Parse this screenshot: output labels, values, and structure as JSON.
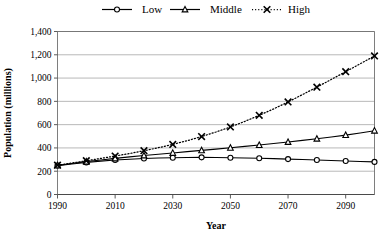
{
  "chart_data": {
    "type": "line",
    "title": "",
    "xlabel": "Year",
    "ylabel": "Population (millions)",
    "xlim": [
      1990,
      2100
    ],
    "ylim": [
      0,
      1400
    ],
    "ytick_step": 200,
    "xtick_step": 20,
    "grid": true,
    "legend_position": "top-center",
    "yticks": [
      "0",
      "200",
      "400",
      "600",
      "800",
      "1,000",
      "1,200",
      "1,400"
    ],
    "ytick_values": [
      0,
      200,
      400,
      600,
      800,
      1000,
      1200,
      1400
    ],
    "xticks": [
      "1990",
      "2010",
      "2030",
      "2050",
      "2070",
      "2090"
    ],
    "xtick_values": [
      1990,
      2010,
      2030,
      2050,
      2070,
      2090
    ],
    "x": [
      1990,
      1995,
      2000,
      2005,
      2010,
      2015,
      2020,
      2025,
      2030,
      2035,
      2040,
      2045,
      2050,
      2055,
      2060,
      2065,
      2070,
      2075,
      2080,
      2085,
      2090,
      2095,
      2100
    ],
    "series": [
      {
        "name": "Low",
        "marker": "circle",
        "line_style": "solid",
        "color": "#000000",
        "values": [
          248,
          262,
          275,
          287,
          296,
          303,
          309,
          313,
          316,
          318,
          319,
          318,
          316,
          314,
          311,
          308,
          304,
          300,
          296,
          292,
          288,
          284,
          280
        ]
      },
      {
        "name": "Middle",
        "marker": "triangle",
        "line_style": "solid",
        "color": "#000000",
        "values": [
          250,
          266,
          282,
          296,
          310,
          323,
          335,
          346,
          357,
          368,
          379,
          390,
          401,
          413,
          425,
          438,
          451,
          465,
          479,
          494,
          510,
          528,
          548
        ]
      },
      {
        "name": "High",
        "marker": "x",
        "line_style": "dotted",
        "color": "#000000",
        "values": [
          252,
          270,
          290,
          310,
          330,
          352,
          376,
          402,
          430,
          462,
          498,
          537,
          580,
          628,
          680,
          735,
          795,
          858,
          922,
          988,
          1055,
          1122,
          1190
        ]
      }
    ]
  },
  "legend": {
    "items": [
      {
        "label": "Low"
      },
      {
        "label": "Middle"
      },
      {
        "label": "High"
      }
    ]
  }
}
